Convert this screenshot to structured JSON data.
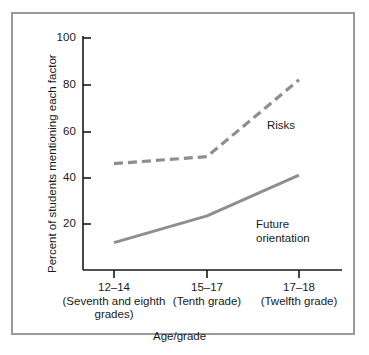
{
  "chart_data": {
    "type": "line",
    "title": "",
    "xlabel": "Age/grade",
    "ylabel": "Percent of students mentioning each factor",
    "categories": [
      "12-14",
      "15-17",
      "17-18"
    ],
    "category_sublabels": [
      "(Seventh and eighth grades)",
      "(Tenth grade)",
      "(Twelfth grade)"
    ],
    "x": [
      0,
      1,
      2
    ],
    "ylim": [
      0,
      100
    ],
    "yticks": [
      20,
      40,
      60,
      80,
      100
    ],
    "ytick_labels": [
      "20",
      "40",
      "60",
      "80",
      "100"
    ],
    "grid": false,
    "legend": "inline-annotations",
    "series": [
      {
        "name": "Risks",
        "values": [
          46,
          49,
          82
        ],
        "style": "dashed",
        "color": "#8e8e92"
      },
      {
        "name": "Future orientation",
        "values": [
          12,
          23.5,
          41
        ],
        "style": "solid",
        "color": "#8e8e92"
      }
    ],
    "annotations": [
      {
        "text": "Risks",
        "series": "Risks"
      },
      {
        "text": "Future orientation",
        "series": "Future orientation"
      }
    ]
  },
  "axes": {
    "y_ticks": [
      {
        "label": "100"
      },
      {
        "label": "80"
      },
      {
        "label": "60"
      },
      {
        "label": "40"
      },
      {
        "label": "20"
      }
    ],
    "x_ticks": [
      {
        "main": "12–14",
        "sub_line1": "(Seventh and eighth",
        "sub_line2": "grades)"
      },
      {
        "main": "15–17",
        "sub_line1": "(Tenth grade)",
        "sub_line2": ""
      },
      {
        "main": "17–18",
        "sub_line1": "(Twelfth grade)",
        "sub_line2": ""
      }
    ],
    "y_axis_title": "Percent of students mentioning each factor",
    "x_axis_title": "Age/grade"
  },
  "series_labels": {
    "risks": "Risks",
    "future_line1": "Future",
    "future_line2": "orientation"
  },
  "colors": {
    "frame_border": "#9a9a9e",
    "axis": "#1a1a1a",
    "series": "#8e8e92",
    "background": "#ffffff",
    "text": "#1a1a1a"
  }
}
